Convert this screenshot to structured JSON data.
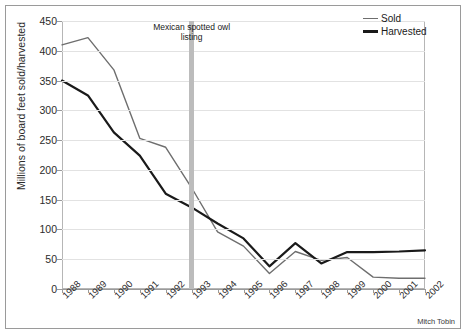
{
  "credit": "Mitch Tobin",
  "annotation": {
    "label": "Mexican spotted owl listing",
    "line1": "Mexican spotted owl",
    "line2": "listing",
    "at_category": "1993",
    "band_color": "#bcbcbc"
  },
  "legend": {
    "position": "top-right",
    "entries": [
      {
        "label": "Sold",
        "color": "#6e6e6e",
        "width": 1.4
      },
      {
        "label": "Harvested",
        "color": "#1a1a1a",
        "width": 2.2
      }
    ]
  },
  "chart_data": {
    "type": "line",
    "title": "",
    "subtitle": "",
    "xlabel": "",
    "ylabel": "Millions of board feet sold/harvested",
    "ylim": [
      0,
      450
    ],
    "ytick_step": 50,
    "yticks": [
      "0",
      "50",
      "100",
      "150",
      "200",
      "250",
      "300",
      "350",
      "400",
      "450"
    ],
    "grid": true,
    "legend_position": "top-right",
    "categories": [
      "1988",
      "1989",
      "1990",
      "1991",
      "1992",
      "1993",
      "1994",
      "1995",
      "1996",
      "1997",
      "1998",
      "1999",
      "2000",
      "2001",
      "2002"
    ],
    "series": [
      {
        "name": "Sold",
        "color": "#6e6e6e",
        "values": [
          410,
          422,
          368,
          253,
          238,
          170,
          96,
          72,
          26,
          63,
          48,
          53,
          20,
          18,
          18
        ]
      },
      {
        "name": "Harvested",
        "color": "#1a1a1a",
        "values": [
          350,
          325,
          263,
          224,
          160,
          137,
          110,
          85,
          38,
          77,
          43,
          62,
          62,
          63,
          65
        ]
      }
    ]
  }
}
